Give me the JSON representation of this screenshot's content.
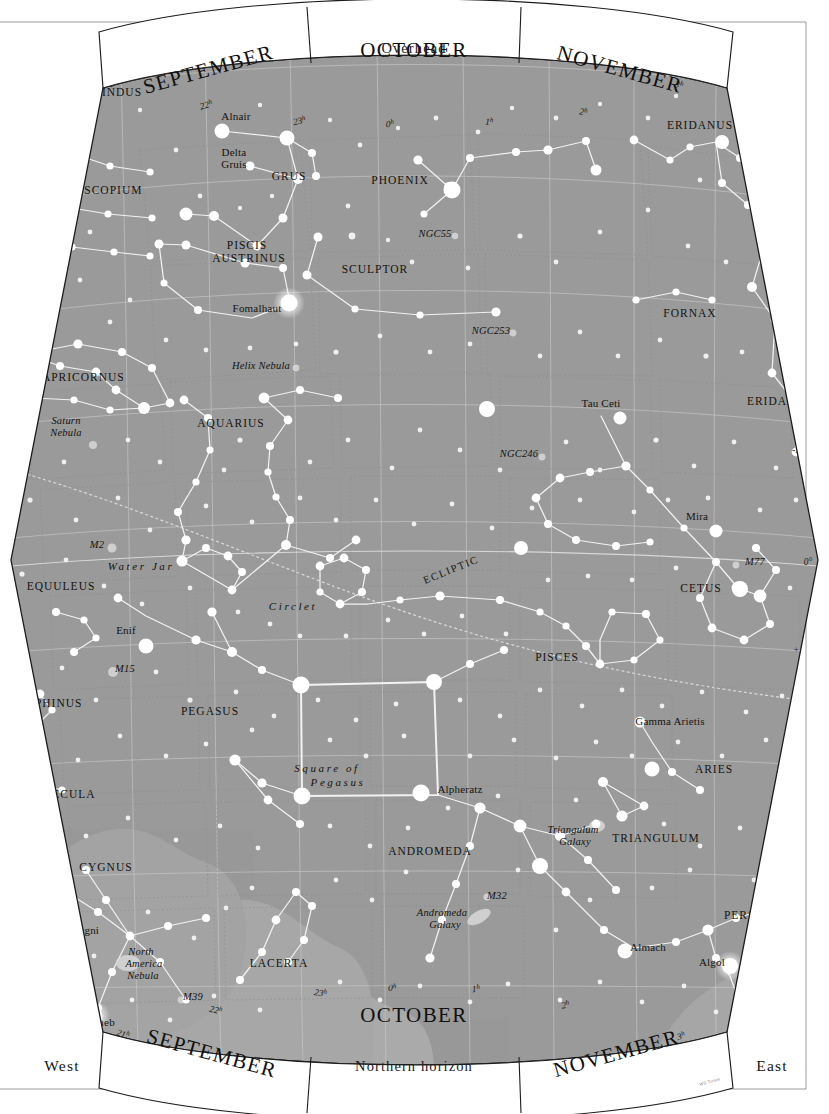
{
  "meta": {
    "credit": "Wil Tirion"
  },
  "frame": {
    "overhead_label": "Overhead",
    "horizon_label": "Northern horizon",
    "west_label": "West",
    "east_label": "East"
  },
  "months_top": [
    {
      "label": "SEPTEMBER"
    },
    {
      "label": "OCTOBER"
    },
    {
      "label": "NOVEMBER"
    }
  ],
  "months_bottom": [
    {
      "label": "SEPTEMBER"
    },
    {
      "label": "OCTOBER"
    },
    {
      "label": "NOVEMBER"
    }
  ],
  "declination_labels_left": [
    "-50°",
    "-40°",
    "-30°",
    "-20°",
    "0°",
    "10°",
    "+20°",
    "+30°",
    "+40°",
    "+50°"
  ],
  "declination_labels_right": [
    "-50°",
    "-40°",
    "-30°",
    "-20°",
    "-10°",
    "0°",
    "+10°",
    "+20°",
    "+30°",
    "+40°",
    "+50°"
  ],
  "ra_labels_top": [
    "21",
    "22",
    "23",
    "0",
    "1",
    "2",
    "3"
  ],
  "ra_labels_bottom": [
    "21",
    "22",
    "23",
    "0",
    "1",
    "2",
    "3"
  ],
  "ecliptic_label": "ECLIPTIC",
  "constellations": [
    {
      "name": "INDUS",
      "x": 122,
      "y": 96,
      "cls": "const"
    },
    {
      "name": "MICROSCOPIUM",
      "x": 92,
      "y": 194,
      "cls": "const"
    },
    {
      "name": "GRUS",
      "x": 289,
      "y": 180,
      "cls": "const"
    },
    {
      "name": "PHOENIX",
      "x": 400,
      "y": 184,
      "cls": "const"
    },
    {
      "name": "ERIDANUS",
      "x": 700,
      "y": 129,
      "cls": "const"
    },
    {
      "name": "PISCIS",
      "x": 247,
      "y": 249,
      "cls": "const"
    },
    {
      "name": "AUSTRINUS",
      "x": 249,
      "y": 262,
      "cls": "const"
    },
    {
      "name": "SCULPTOR",
      "x": 375,
      "y": 273,
      "cls": "const"
    },
    {
      "name": "FORNAX",
      "x": 690,
      "y": 317,
      "cls": "const"
    },
    {
      "name": "CAPRICORNUS",
      "x": 79,
      "y": 381,
      "cls": "const"
    },
    {
      "name": "AQUARIUS",
      "x": 231,
      "y": 427,
      "cls": "const"
    },
    {
      "name": "ERIDANUS",
      "x": 780,
      "y": 405,
      "cls": "const"
    },
    {
      "name": "EQUULEUS",
      "x": 61,
      "y": 590,
      "cls": "const"
    },
    {
      "name": "CETUS",
      "x": 701,
      "y": 592,
      "cls": "const"
    },
    {
      "name": "PISCES",
      "x": 557,
      "y": 661,
      "cls": "const"
    },
    {
      "name": "DELPHINUS",
      "x": 46,
      "y": 707,
      "cls": "const"
    },
    {
      "name": "PEGASUS",
      "x": 210,
      "y": 715,
      "cls": "const"
    },
    {
      "name": "ARIES",
      "x": 714,
      "y": 773,
      "cls": "const"
    },
    {
      "name": "VULPECULA",
      "x": 57,
      "y": 798,
      "cls": "const"
    },
    {
      "name": "TRIANGULUM",
      "x": 656,
      "y": 842,
      "cls": "const"
    },
    {
      "name": "ANDROMEDA",
      "x": 430,
      "y": 855,
      "cls": "const"
    },
    {
      "name": "CYGNUS",
      "x": 106,
      "y": 871,
      "cls": "const"
    },
    {
      "name": "PERSEUS",
      "x": 752,
      "y": 919,
      "cls": "const"
    },
    {
      "name": "LACERTA",
      "x": 279,
      "y": 967,
      "cls": "const"
    }
  ],
  "stars_named": [
    {
      "name": "Alnair",
      "x": 236,
      "y": 120
    },
    {
      "name": "Delta",
      "x": 234,
      "y": 156
    },
    {
      "name": "Gruis",
      "x": 234,
      "y": 168
    },
    {
      "name": "Fomalhaut",
      "x": 257,
      "y": 312
    },
    {
      "name": "Tau Ceti",
      "x": 601,
      "y": 407
    },
    {
      "name": "Mira",
      "x": 697,
      "y": 520
    },
    {
      "name": "Enif",
      "x": 126,
      "y": 634
    },
    {
      "name": "Alpheratz",
      "x": 460,
      "y": 793
    },
    {
      "name": "Gamma Arietis",
      "x": 670,
      "y": 725
    },
    {
      "name": "Almach",
      "x": 648,
      "y": 951
    },
    {
      "name": "Algol",
      "x": 712,
      "y": 966
    },
    {
      "name": "61 Cygni",
      "x": 78,
      "y": 934
    },
    {
      "name": "Deneb",
      "x": 100,
      "y": 1026
    }
  ],
  "deep_sky": [
    {
      "name": "NGC55",
      "x": 435,
      "y": 237
    },
    {
      "name": "NGC253",
      "x": 491,
      "y": 334
    },
    {
      "name": "Helix Nebula",
      "x": 261,
      "y": 369
    },
    {
      "name": "Saturn",
      "x": 66,
      "y": 424
    },
    {
      "name": "Nebula",
      "x": 66,
      "y": 436
    },
    {
      "name": "NGC246",
      "x": 519,
      "y": 457
    },
    {
      "name": "M2",
      "x": 97,
      "y": 548
    },
    {
      "name": "M77",
      "x": 755,
      "y": 565
    },
    {
      "name": "M15",
      "x": 125,
      "y": 672
    },
    {
      "name": "Triangulum",
      "x": 573,
      "y": 833
    },
    {
      "name": "Galaxy",
      "x": 575,
      "y": 845
    },
    {
      "name": "M32",
      "x": 497,
      "y": 899
    },
    {
      "name": "Andromeda",
      "x": 442,
      "y": 916
    },
    {
      "name": "Galaxy",
      "x": 445,
      "y": 928
    },
    {
      "name": "North",
      "x": 141,
      "y": 955
    },
    {
      "name": "America",
      "x": 144,
      "y": 967
    },
    {
      "name": "Nebula",
      "x": 143,
      "y": 979
    },
    {
      "name": "M39",
      "x": 193,
      "y": 1000
    }
  ],
  "asterisms": [
    {
      "name": "Water Jar",
      "x": 141,
      "y": 570
    },
    {
      "name": "Circlet",
      "x": 293,
      "y": 610
    },
    {
      "name": "Square of",
      "x": 327,
      "y": 772
    },
    {
      "name": "Pegasus",
      "x": 338,
      "y": 786
    }
  ],
  "colors": {
    "sky": "#9a9a9a",
    "milky_way": "#ababab",
    "star": "#ffffff",
    "constellation_line": "#f2f2f2",
    "grid": "#c9c9c9",
    "boundary": "#8e8e8e",
    "band_fill": "#ffffff",
    "ink": "#1c1c1c"
  }
}
